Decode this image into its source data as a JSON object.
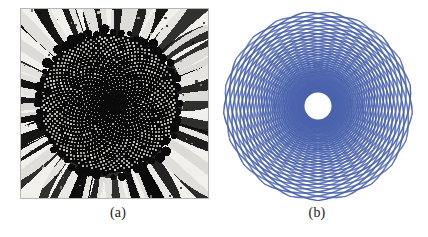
{
  "figure": {
    "background_color": "#ffffff",
    "width": 428,
    "height": 237,
    "panels": [
      {
        "id": "a",
        "caption": "(a)",
        "type": "photograph",
        "subject": "sunflower-head",
        "rendering": "high-contrast black and white halftone",
        "colors": {
          "ink": "#0a0a0a",
          "paper": "#f2f0ec"
        },
        "frame": {
          "x": 20,
          "y": 8,
          "width": 189,
          "height": 191
        },
        "disc": {
          "center_x": 0.47,
          "center_y": 0.5,
          "radius": 0.36
        },
        "description": "Sunflower capitulum showing spirally packed seed florets in the dark central disc surrounded by radiating ray petals"
      },
      {
        "id": "b",
        "caption": "(b)",
        "type": "diagram",
        "subject": "phyllotaxis-spiral-lattice",
        "colors": {
          "stroke": "#4a63ac",
          "stroke_light": "#7086c6",
          "hole": "#ffffff"
        },
        "frame": {
          "x": 220,
          "y": 8,
          "width": 196,
          "height": 196
        },
        "center": {
          "x": 98,
          "y": 98
        },
        "outer_radius": 95,
        "inner_hole_radius": 13,
        "description": "Two counter-rotating families of logarithmic spiral arcs forming a parastichy lattice, with a blank circular core"
      }
    ]
  },
  "chart_data": {
    "type": "scatter",
    "title": "",
    "subtitle": "",
    "xlabel": "",
    "ylabel": "",
    "legend_position": "none",
    "grid": false,
    "panels": [
      {
        "label": "(a)",
        "kind": "image",
        "notes": "binarized photograph of a sunflower head; no numeric axes"
      },
      {
        "label": "(b)",
        "kind": "parametric-curves",
        "model": "logarithmic-spiral-parastichies",
        "clockwise_spiral_count": 21,
        "counterclockwise_spiral_count": 21,
        "divergence_angle_deg": 137.5,
        "growth_factor_b": 0.165,
        "r_min": 13,
        "r_max": 95,
        "stroke_width": 1.6,
        "stroke_color": "#4a63ac"
      }
    ]
  }
}
